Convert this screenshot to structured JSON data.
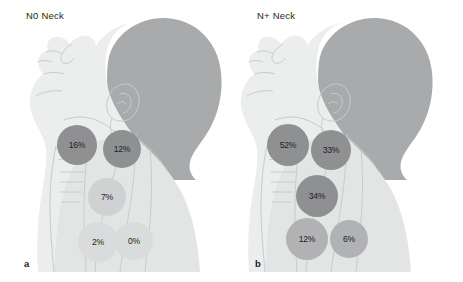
{
  "figure": {
    "colors": {
      "background": "#ffffff",
      "skin_light": "#eceded",
      "skin_mid": "#e3e5e5",
      "hair_dark": "#a8aaac",
      "outline": "#c9cbcc",
      "node_dark": "#8e9092",
      "node_mid": "#b0b2b4",
      "node_light": "#cfd1d2",
      "node_lightest": "#d9dbdc",
      "text": "#231f20"
    }
  },
  "panels": [
    {
      "id": "a",
      "letter": "a",
      "title": "N0 Neck",
      "nodes": [
        {
          "label": "16%",
          "level": "II",
          "value": 16,
          "shade": "dark",
          "x": 57,
          "y": 125,
          "d": 40
        },
        {
          "label": "12%",
          "level": "III",
          "value": 12,
          "shade": "dark",
          "x": 103,
          "y": 130,
          "d": 38
        },
        {
          "label": "7%",
          "level": "IV",
          "value": 7,
          "shade": "light",
          "x": 88,
          "y": 178,
          "d": 38
        },
        {
          "label": "2%",
          "level": "V",
          "value": 2,
          "shade": "lightest",
          "x": 78,
          "y": 222,
          "d": 40
        },
        {
          "label": "0%",
          "level": "I",
          "value": 0,
          "shade": "lightest",
          "x": 115,
          "y": 222,
          "d": 38
        }
      ]
    },
    {
      "id": "b",
      "letter": "b",
      "title": "N+ Neck",
      "nodes": [
        {
          "label": "52%",
          "level": "II",
          "value": 52,
          "shade": "dark",
          "x": 36,
          "y": 124,
          "d": 42
        },
        {
          "label": "33%",
          "level": "III",
          "value": 33,
          "shade": "dark",
          "x": 80,
          "y": 130,
          "d": 40
        },
        {
          "label": "34%",
          "level": "IV",
          "value": 34,
          "shade": "dark",
          "x": 65,
          "y": 175,
          "d": 42
        },
        {
          "label": "12%",
          "level": "V",
          "value": 12,
          "shade": "mid",
          "x": 55,
          "y": 218,
          "d": 42
        },
        {
          "label": "6%",
          "level": "I",
          "value": 6,
          "shade": "mid",
          "x": 99,
          "y": 220,
          "d": 38
        }
      ]
    }
  ],
  "chart_data": {
    "type": "table",
    "xlabel": "Neck level",
    "ylabel": "Percent involved (%)",
    "categories": [
      "II",
      "III",
      "IV",
      "V",
      "I"
    ],
    "series": [
      {
        "name": "N0 Neck",
        "values": [
          16,
          12,
          7,
          2,
          0
        ]
      },
      {
        "name": "N+ Neck",
        "values": [
          52,
          33,
          34,
          12,
          6
        ]
      }
    ],
    "ylim": [
      0,
      100
    ],
    "grid": false,
    "legend": "none"
  }
}
